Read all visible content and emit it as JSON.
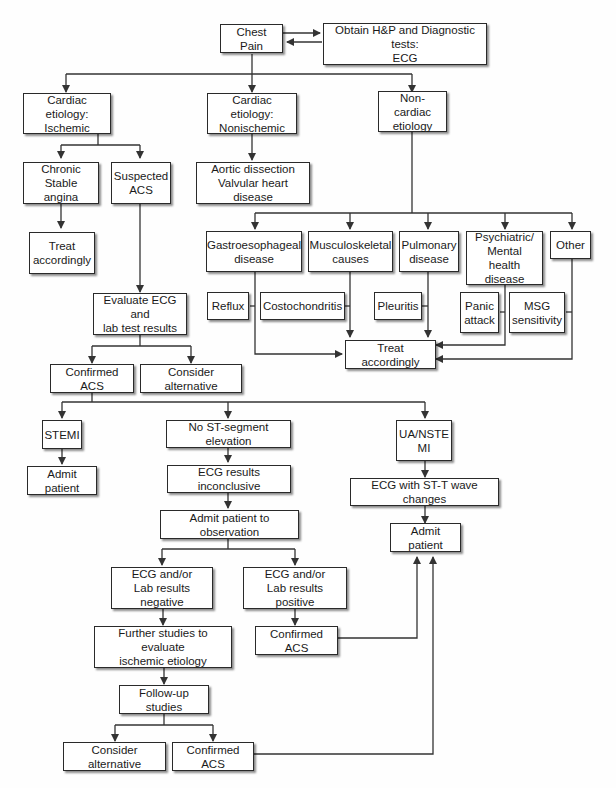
{
  "diagram": {
    "type": "flowchart",
    "topic": "Chest pain evaluation",
    "nodes": {
      "chest_pain": "Chest Pain",
      "obtain_hp": "Obtain H&P and Diagnostic tests:\nECG",
      "cardiac_ischemic": "Cardiac etiology:\nIschemic",
      "cardiac_nonischemic": "Cardiac etiology:\nNonischemic",
      "noncardiac": "Non-cardiac\netiology",
      "chronic_stable": "Chronic\nStable angina",
      "suspected_acs": "Suspected\nACS",
      "aortic": "Aortic dissection\nValvular heart disease",
      "treat_1": "Treat\naccordingly",
      "gastro": "Gastroesophageal\ndisease",
      "musculo": "Musculoskeletal\ncauses",
      "pulmonary": "Pulmonary\ndisease",
      "psych": "Psychiatric/\nMental health\ndisease",
      "other": "Other",
      "reflux": "Reflux",
      "costo": "Costochondritis",
      "pleuritis": "Pleuritis",
      "panic": "Panic\nattack",
      "msg": "MSG\nsensitivity",
      "treat_2": "Treat accordingly",
      "evaluate_ecg": "Evaluate ECG and\nlab test results",
      "confirmed_acs_1": "Confirmed ACS",
      "consider_alt_1": "Consider alternative",
      "stemi": "STEMI",
      "no_st": "No ST-segment elevation",
      "ua_nste": "UA/NSTE\nMI",
      "admit_1": "Admit patient",
      "ecg_inconclusive": "ECG results inconclusive",
      "ecg_st_t": "ECG with ST-T wave changes",
      "admit_obs": "Admit patient to observation",
      "admit_2": "Admit patient",
      "ecg_negative": "ECG and/or\nLab results negative",
      "ecg_positive": "ECG and/or\nLab results positive",
      "further_studies": "Further studies to evaluate\nischemic etiology",
      "confirmed_acs_2": "Confirmed ACS",
      "followup": "Follow-up studies",
      "consider_alt_2": "Consider alternative",
      "confirmed_acs_3": "Confirmed ACS"
    }
  }
}
